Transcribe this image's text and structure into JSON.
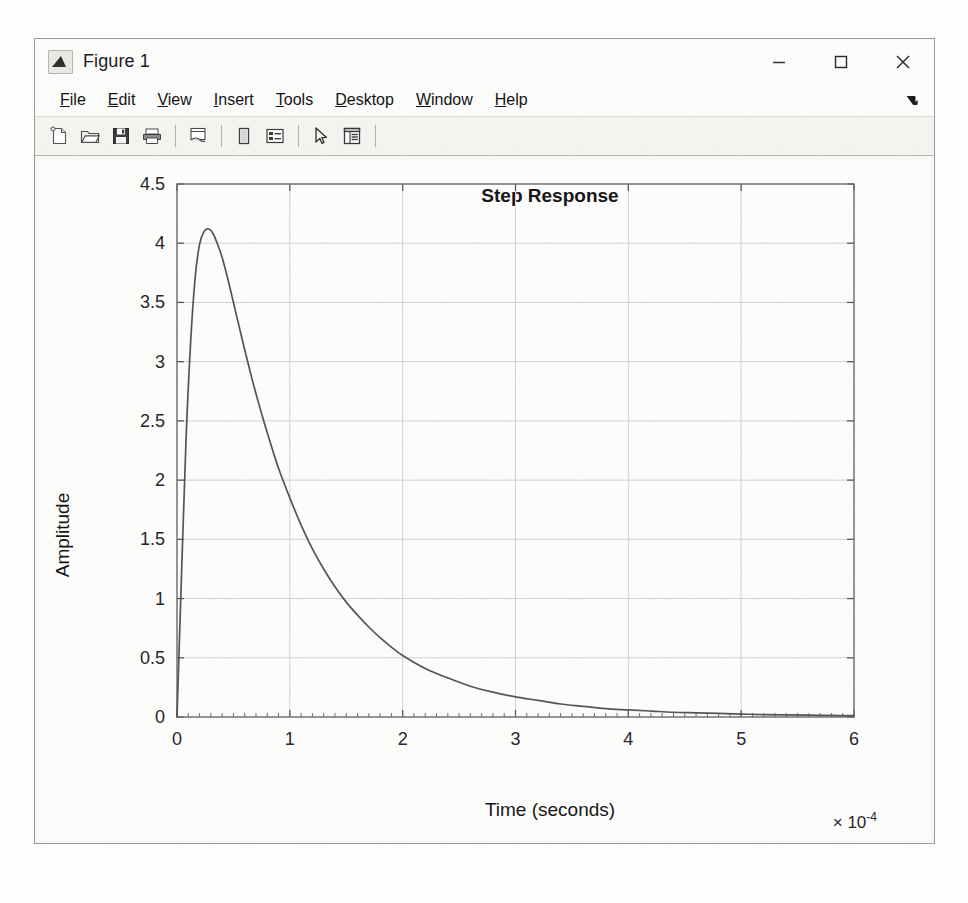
{
  "window": {
    "title": "Figure 1",
    "icon": "matlab-icon",
    "controls": [
      {
        "name": "minimize-button",
        "glyph": "minimize"
      },
      {
        "name": "maximize-button",
        "glyph": "maximize"
      },
      {
        "name": "close-button",
        "glyph": "close"
      }
    ]
  },
  "menubar": {
    "items": [
      {
        "label": "File",
        "mnemonic": "F"
      },
      {
        "label": "Edit",
        "mnemonic": "E"
      },
      {
        "label": "View",
        "mnemonic": "V"
      },
      {
        "label": "Insert",
        "mnemonic": "I"
      },
      {
        "label": "Tools",
        "mnemonic": "T"
      },
      {
        "label": "Desktop",
        "mnemonic": "D"
      },
      {
        "label": "Window",
        "mnemonic": "W"
      },
      {
        "label": "Help",
        "mnemonic": "H"
      }
    ],
    "overflow_icon": "overflow-arrow-icon"
  },
  "toolbar": {
    "buttons": [
      {
        "name": "new-figure-button",
        "icon": "new-document-icon"
      },
      {
        "name": "open-file-button",
        "icon": "open-folder-icon"
      },
      {
        "name": "save-figure-button",
        "icon": "floppy-disk-icon"
      },
      {
        "name": "print-figure-button",
        "icon": "printer-icon"
      },
      {
        "name": "link-plot-button",
        "icon": "link-plot-icon"
      },
      {
        "name": "insert-colorbar-button",
        "icon": "colorbar-icon"
      },
      {
        "name": "insert-legend-button",
        "icon": "legend-icon"
      },
      {
        "name": "edit-plot-button",
        "icon": "pointer-arrow-icon"
      },
      {
        "name": "property-inspector-button",
        "icon": "property-inspector-icon"
      }
    ]
  },
  "chart_data": {
    "type": "line",
    "title": "Step Response",
    "xlabel": "Time (seconds)",
    "ylabel": "Amplitude",
    "x_exponent_label": "× 10",
    "x_exponent_value": "-4",
    "xlim": [
      0,
      6
    ],
    "ylim": [
      0,
      4.5
    ],
    "xticks": [
      0,
      1,
      2,
      3,
      4,
      5,
      6
    ],
    "yticks": [
      0,
      0.5,
      1,
      1.5,
      2,
      2.5,
      3,
      3.5,
      4,
      4.5
    ],
    "grid": true,
    "legend": "none",
    "line_color": "#555555",
    "series": [
      {
        "name": "step-response",
        "x": [
          0,
          0.04,
          0.08,
          0.12,
          0.16,
          0.2,
          0.24,
          0.28,
          0.32,
          0.36,
          0.4,
          0.45,
          0.5,
          0.55,
          0.6,
          0.65,
          0.7,
          0.8,
          0.9,
          1.0,
          1.1,
          1.2,
          1.3,
          1.4,
          1.5,
          1.6,
          1.7,
          1.8,
          1.9,
          2.0,
          2.2,
          2.4,
          2.6,
          2.8,
          3.0,
          3.2,
          3.4,
          3.6,
          3.8,
          4.0,
          4.2,
          4.4,
          4.6,
          4.8,
          5.0,
          5.2,
          5.4,
          5.6,
          5.8,
          6.0
        ],
        "y": [
          0.0,
          1.2,
          2.34,
          3.15,
          3.7,
          3.99,
          4.1,
          4.12,
          4.08,
          3.99,
          3.88,
          3.7,
          3.5,
          3.3,
          3.1,
          2.91,
          2.73,
          2.4,
          2.1,
          1.85,
          1.62,
          1.42,
          1.25,
          1.1,
          0.97,
          0.86,
          0.76,
          0.67,
          0.59,
          0.52,
          0.41,
          0.33,
          0.26,
          0.21,
          0.17,
          0.14,
          0.11,
          0.09,
          0.07,
          0.06,
          0.05,
          0.04,
          0.035,
          0.03,
          0.025,
          0.02,
          0.018,
          0.015,
          0.013,
          0.011
        ]
      }
    ]
  }
}
